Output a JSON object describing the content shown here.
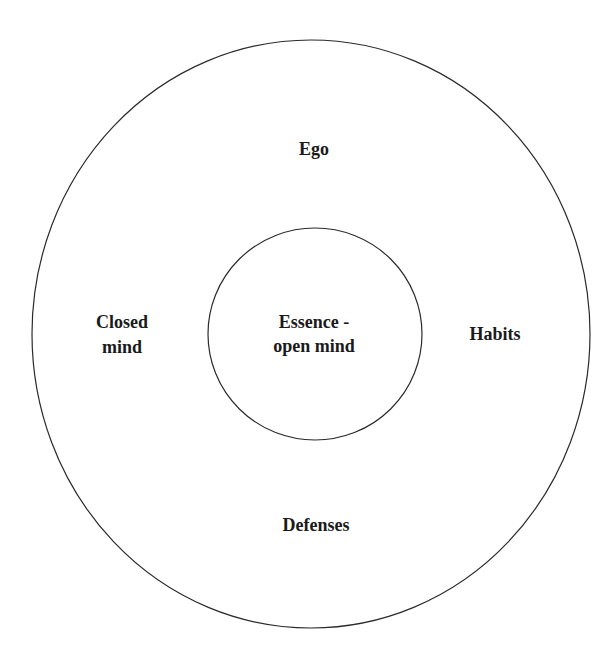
{
  "diagram": {
    "type": "concentric-circles",
    "outer_circle": {
      "name": "outer-layer",
      "labels": {
        "top": "Ego",
        "left_line1": "Closed",
        "left_line2": "mind",
        "right": "Habits",
        "bottom": "Defenses"
      }
    },
    "inner_circle": {
      "name": "core",
      "label_line1": "Essence -",
      "label_line2": "open mind"
    },
    "colors": {
      "stroke": "#2a2a2a",
      "text": "#1a1a1a",
      "background": "#ffffff"
    }
  }
}
